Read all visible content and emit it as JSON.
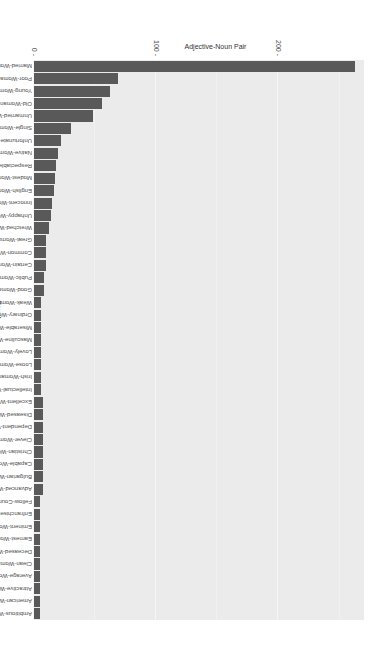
{
  "chart_data": {
    "type": "bar",
    "orientation": "vertical bars, image rotated 90deg",
    "title": "",
    "xlabel": "Adjective-Noun Pair",
    "ylabel": "Count",
    "ylim": [
      0,
      270
    ],
    "yticks": [
      0,
      100,
      200
    ],
    "grid": true,
    "categories": [
      "Married-Woman",
      "Poor-Woman",
      "Young-Woman",
      "Old-Woman",
      "Unmarried-Woman",
      "Single-Woman",
      "Unfortunate-Woman",
      "Native-Woman",
      "Respectable-Woman",
      "Modest-Woman",
      "English-Woman",
      "Innocent-Woman",
      "Unhappy-Woman",
      "Wretched-Woman",
      "Great-Woman",
      "Common-Woman",
      "Certain-Woman",
      "Public-Woman",
      "Good-Woman",
      "Weak-Woman",
      "Ordinary-Woman",
      "Miserable-Woman",
      "Masculine-Woman",
      "Lovely-Woman",
      "Loose-Woman",
      "Irish-Woman",
      "Intellectual-Woman",
      "Excellent-Woman",
      "Diseased-Woman",
      "Dependent-Woman",
      "Clever-Woman",
      "Christian-Woman",
      "Capable-Woman",
      "Bulgarian-Woman",
      "Advanced-Woman",
      "Fellow-Countrywoman",
      "Enfranchised-Woman",
      "Eminent-Woman",
      "Earnest-Woman",
      "Deceased-Woman",
      "Clean-Woman",
      "Average-Woman",
      "Attractive-Woman",
      "American-Woman",
      "Ambitious-Woman"
    ],
    "values": [
      263,
      69,
      62,
      56,
      48,
      30,
      22,
      20,
      18,
      17,
      16,
      15,
      14,
      12,
      10,
      10,
      10,
      8,
      8,
      6,
      6,
      6,
      6,
      6,
      6,
      6,
      6,
      7,
      7,
      7,
      7,
      7,
      7,
      7,
      7,
      5,
      5,
      5,
      5,
      5,
      5,
      5,
      5,
      5,
      5
    ]
  }
}
